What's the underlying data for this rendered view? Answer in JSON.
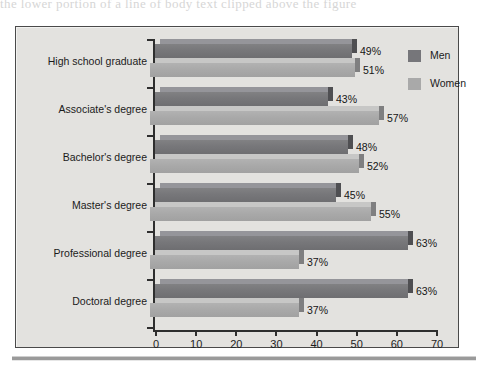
{
  "page": {
    "top_text_sliver": "the lower portion of a line of body text clipped above the figure"
  },
  "chart_data": {
    "type": "bar",
    "orientation": "horizontal",
    "style": "3d",
    "title": "",
    "subtitle": "",
    "xlabel": "",
    "ylabel": "",
    "categories": [
      "High school graduate",
      "Associate's degree",
      "Bachelor's degree",
      "Master's degree",
      "Professional degree",
      "Doctoral degree"
    ],
    "series": [
      {
        "name": "Men",
        "color": "#76767a",
        "values": [
          49,
          43,
          48,
          45,
          63,
          63
        ]
      },
      {
        "name": "Women",
        "color": "#a9a9a9",
        "values": [
          51,
          57,
          52,
          55,
          37,
          37
        ]
      }
    ],
    "value_labels": {
      "Men": [
        "49%",
        "43%",
        "48%",
        "45%",
        "63%",
        "63%"
      ],
      "Women": [
        "51%",
        "57%",
        "52%",
        "55%",
        "37%",
        "37%"
      ]
    },
    "xlim": [
      0,
      70
    ],
    "xticks": [
      0,
      10,
      20,
      30,
      40,
      50,
      60,
      70
    ],
    "xtick_labels": [
      "0",
      "10",
      "20",
      "30",
      "40",
      "50",
      "60",
      "70"
    ],
    "grid": false,
    "legend_position": "top-right",
    "legend": [
      "Men",
      "Women"
    ],
    "panel_background": "#e3e2df",
    "panel_border": "#4a4a4a"
  }
}
